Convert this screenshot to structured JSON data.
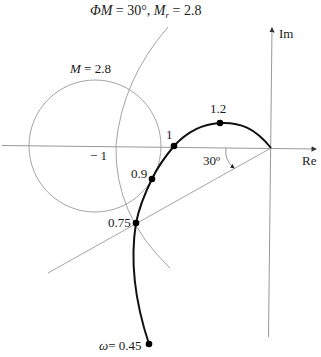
{
  "title": {
    "phi": "ΦM",
    "eq1": " = 30°, ",
    "mr": "M",
    "sub_r": "r",
    "eq2": " = 2.8"
  },
  "axes": {
    "real_label": "Re",
    "imag_label": "Im",
    "minus_one_label": "− 1"
  },
  "m_circle": {
    "label_m": "M",
    "label_val": " = 2.8",
    "value": 2.8
  },
  "phase_margin": {
    "angle_label": "30º",
    "angle_deg": 30
  },
  "frequency_points": [
    {
      "omega": 0.45,
      "label_prefix": "ω",
      "label": "= 0.45"
    },
    {
      "omega": 0.75,
      "label": "0.75"
    },
    {
      "omega": 0.9,
      "label": "0.9"
    },
    {
      "omega": 1,
      "label": "1"
    },
    {
      "omega": 1.2,
      "label": "1.2"
    }
  ],
  "colors": {
    "curve": "#111111",
    "construction_lines": "#9a9a9a",
    "axes": "#8c8c8c",
    "background": "#ffffff"
  }
}
